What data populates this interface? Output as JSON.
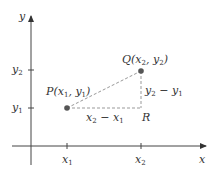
{
  "diagram": {
    "type": "coordinate-distance-diagram",
    "axes": {
      "x_label": "x",
      "y_label": "y"
    },
    "x_ticks": [
      {
        "var": "x",
        "sub": "1"
      },
      {
        "var": "x",
        "sub": "2"
      }
    ],
    "y_ticks": [
      {
        "var": "y",
        "sub": "2"
      },
      {
        "var": "y",
        "sub": "1"
      }
    ],
    "points": {
      "P": {
        "name": "P",
        "x_var": "x",
        "x_sub": "1",
        "y_var": "y",
        "y_sub": "1"
      },
      "Q": {
        "name": "Q",
        "x_var": "x",
        "x_sub": "2",
        "y_var": "y",
        "y_sub": "2"
      },
      "R": {
        "name": "R"
      }
    },
    "segments": {
      "horizontal": {
        "a": "x",
        "a_sub": "2",
        "op": " − ",
        "b": "x",
        "b_sub": "1"
      },
      "vertical": {
        "a": "y",
        "a_sub": "2",
        "op": " − ",
        "b": "y",
        "b_sub": "1"
      }
    },
    "colors": {
      "axis": "#333333",
      "dashed": "#999999",
      "point": "#555555",
      "text": "#333333"
    }
  }
}
